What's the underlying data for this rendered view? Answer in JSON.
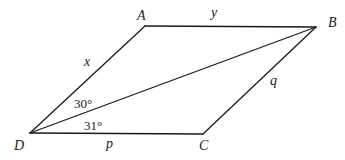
{
  "diagram": {
    "type": "parallelogram-with-diagonal",
    "vertices": [
      {
        "id": "A",
        "label": "A",
        "x": 145,
        "y": 26,
        "lx": 137,
        "ly": 20
      },
      {
        "id": "B",
        "label": "B",
        "x": 316,
        "y": 27,
        "lx": 328,
        "ly": 27
      },
      {
        "id": "C",
        "label": "C",
        "x": 203,
        "y": 134,
        "lx": 199,
        "ly": 150
      },
      {
        "id": "D",
        "label": "D",
        "x": 30,
        "y": 133,
        "lx": 14,
        "ly": 150
      }
    ],
    "sides": [
      {
        "from": "D",
        "to": "A",
        "label": "x",
        "lx": 84,
        "ly": 66
      },
      {
        "from": "A",
        "to": "B",
        "label": "y",
        "lx": 211,
        "ly": 17
      },
      {
        "from": "B",
        "to": "C",
        "label": "q",
        "lx": 270,
        "ly": 85
      },
      {
        "from": "D",
        "to": "C",
        "label": "p",
        "lx": 106,
        "ly": 148
      }
    ],
    "diagonal": {
      "from": "D",
      "to": "B"
    },
    "angles": [
      {
        "label": "30°",
        "at": "D",
        "between": "DA-DB",
        "lx": 74,
        "ly": 108
      },
      {
        "label": "31°",
        "at": "D",
        "between": "DB-DC",
        "lx": 84,
        "ly": 130
      }
    ],
    "stroke_color": "#1a1a1a"
  }
}
